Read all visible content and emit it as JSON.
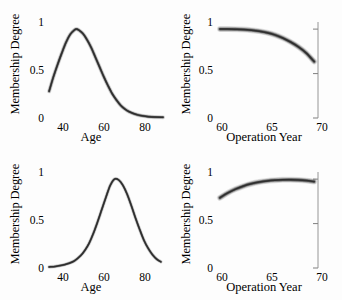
{
  "figure": {
    "background": "#fdfdfd",
    "curve_color": "#2b2b2b",
    "axis_color": "#8a8a8a",
    "panel_count": 4
  },
  "chart_data": [
    {
      "type": "line",
      "panel": "top-left",
      "title": "",
      "xlabel": "Age",
      "ylabel": "Membership Degree",
      "xlim": [
        30,
        85
      ],
      "ylim": [
        0,
        1.08
      ],
      "xticks": [
        40,
        60,
        80
      ],
      "xtick_labels": [
        "40",
        "60",
        "80"
      ],
      "yticks": [
        0,
        0.5,
        1
      ],
      "ytick_labels": [
        "0",
        "0.5",
        "1"
      ],
      "grid": false,
      "legend": "none",
      "band": true,
      "band_width": 0.035,
      "annotation": "Skewed unimodal membership function peaking near age 44",
      "x": [
        31,
        33,
        35,
        37,
        39,
        41,
        43,
        44,
        45,
        47,
        49,
        51,
        53,
        55,
        57,
        59,
        61,
        63,
        65,
        67,
        69,
        71,
        73,
        75,
        78,
        81,
        85
      ],
      "y": [
        0.3,
        0.46,
        0.6,
        0.73,
        0.85,
        0.94,
        0.99,
        1.0,
        0.99,
        0.95,
        0.88,
        0.79,
        0.68,
        0.57,
        0.46,
        0.36,
        0.27,
        0.2,
        0.14,
        0.1,
        0.07,
        0.05,
        0.035,
        0.025,
        0.015,
        0.01,
        0.008
      ]
    },
    {
      "type": "line",
      "panel": "top-right",
      "title": "",
      "xlabel": "Operation Year",
      "ylabel": "Membership Degree",
      "xlim": [
        56.5,
        70
      ],
      "ylim": [
        0,
        1.08
      ],
      "xticks": [
        60,
        65,
        70
      ],
      "xtick_labels": [
        "60",
        "65",
        "70"
      ],
      "yticks": [
        0,
        0.5,
        1
      ],
      "ytick_labels": [
        "0",
        "0.5",
        "1"
      ],
      "grid": false,
      "legend": "none",
      "band": true,
      "band_width": 0.05,
      "right_axis_spine": true,
      "annotation": "Monotone decreasing membership function from 1.0 down to about 0.63",
      "x": [
        57.0,
        58.0,
        59.0,
        60.0,
        61.0,
        62.0,
        63.0,
        64.0,
        65.0,
        66.0,
        67.0,
        68.0,
        69.0
      ],
      "y": [
        1.0,
        1.0,
        0.998,
        0.995,
        0.988,
        0.977,
        0.96,
        0.935,
        0.9,
        0.855,
        0.8,
        0.73,
        0.635
      ]
    },
    {
      "type": "line",
      "panel": "bottom-left",
      "title": "",
      "xlabel": "Age",
      "ylabel": "Membership Degree",
      "xlim": [
        30,
        85
      ],
      "ylim": [
        0,
        1.08
      ],
      "xticks": [
        40,
        60,
        80
      ],
      "xtick_labels": [
        "40",
        "60",
        "80"
      ],
      "yticks": [
        0,
        0.5,
        1
      ],
      "ytick_labels": [
        "0",
        "0.5",
        "1"
      ],
      "grid": false,
      "legend": "none",
      "band": true,
      "band_width": 0.03,
      "annotation": "Gaussian membership function centred near age 62",
      "x": [
        31,
        34,
        37,
        40,
        43,
        46,
        48,
        50,
        52,
        54,
        56,
        58,
        60,
        62,
        64,
        66,
        68,
        70,
        72,
        74,
        76,
        78,
        80,
        82,
        84
      ],
      "y": [
        0.012,
        0.018,
        0.03,
        0.05,
        0.08,
        0.14,
        0.2,
        0.28,
        0.39,
        0.52,
        0.66,
        0.8,
        0.93,
        1.0,
        0.99,
        0.93,
        0.83,
        0.7,
        0.56,
        0.43,
        0.31,
        0.22,
        0.15,
        0.1,
        0.07
      ]
    },
    {
      "type": "line",
      "panel": "bottom-right",
      "title": "",
      "xlabel": "Operation Year",
      "ylabel": "Membership Degree",
      "xlim": [
        56.5,
        70
      ],
      "ylim": [
        0,
        1.08
      ],
      "xticks": [
        60,
        65,
        70
      ],
      "xtick_labels": [
        "60",
        "65",
        "70"
      ],
      "yticks": [
        0,
        0.5,
        1
      ],
      "ytick_labels": [
        "0",
        "0.5",
        "1"
      ],
      "grid": false,
      "legend": "none",
      "band": true,
      "band_width": 0.05,
      "right_axis_spine": true,
      "annotation": "Concave membership function rising from about 0.79 to a plateau near 0.99",
      "x": [
        57.0,
        58.0,
        59.0,
        60.0,
        61.0,
        62.0,
        63.0,
        64.0,
        65.0,
        66.0,
        67.0,
        68.0,
        69.0
      ],
      "y": [
        0.79,
        0.845,
        0.888,
        0.922,
        0.948,
        0.967,
        0.98,
        0.988,
        0.992,
        0.993,
        0.99,
        0.983,
        0.972
      ]
    }
  ],
  "panels": {
    "top_left": {
      "xlabel": "Age",
      "ylabel": "Membership Degree",
      "ytick_1": "1",
      "ytick_05": "0.5",
      "ytick_0": "0",
      "xtick_a": "40",
      "xtick_b": "60",
      "xtick_c": "80"
    },
    "top_right": {
      "xlabel": "Operation Year",
      "ylabel": "Membership Degree",
      "ytick_1": "1",
      "ytick_05": "0.5",
      "ytick_0": "0",
      "xtick_a": "60",
      "xtick_b": "65",
      "xtick_c": "70"
    },
    "bottom_left": {
      "xlabel": "Age",
      "ylabel": "Membership Degree",
      "ytick_1": "1",
      "ytick_05": "0.5",
      "ytick_0": "0",
      "xtick_a": "40",
      "xtick_b": "60",
      "xtick_c": "80"
    },
    "bottom_right": {
      "xlabel": "Operation Year",
      "ylabel": "Membership Degree",
      "ytick_1": "1",
      "ytick_05": "0.5",
      "ytick_0": "0",
      "xtick_a": "60",
      "xtick_b": "65",
      "xtick_c": "70"
    }
  }
}
